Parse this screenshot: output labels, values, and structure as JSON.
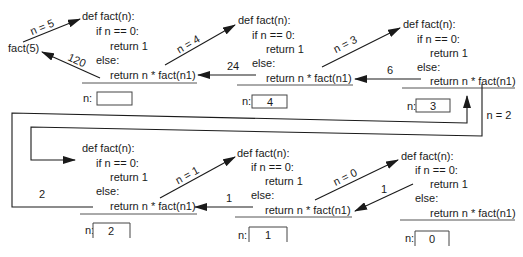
{
  "diagram": {
    "initial_call": "fact(5)",
    "frames": [
      {
        "code": [
          "def fact(n):",
          "if n == 0:",
          "return 1",
          "else:",
          "return n * fact(n1)"
        ],
        "n_label": "n:",
        "n_value": ""
      },
      {
        "code": [
          "def fact(n):",
          "if n == 0:",
          "return 1",
          "else:",
          "return n * fact(n1)"
        ],
        "n_label": "n:",
        "n_value": "4"
      },
      {
        "code": [
          "def fact(n):",
          "if n == 0:",
          "return 1",
          "else:",
          "return n * fact(n1)"
        ],
        "n_label": "n:",
        "n_value": "3"
      },
      {
        "code": [
          "def fact(n):",
          "if n == 0:",
          "return 1",
          "else:",
          "return n * fact(n1)"
        ],
        "n_label": "n:",
        "n_value": "2"
      },
      {
        "code": [
          "def fact(n):",
          "if n == 0:",
          "return 1",
          "else:",
          "return n * fact(n1)"
        ],
        "n_label": "n:",
        "n_value": "1"
      },
      {
        "code": [
          "def fact(n):",
          "if n == 0:",
          "return 1",
          "else:",
          "return n * fact(n1)"
        ],
        "n_label": "n:",
        "n_value": "0"
      }
    ],
    "call_labels": [
      "n = 5",
      "n = 4",
      "n = 3",
      "n = 2",
      "n = 1",
      "n = 0"
    ],
    "return_labels": [
      "120",
      "24",
      "6",
      "2",
      "1",
      "1"
    ],
    "colors": {
      "line": "#1a1a1a",
      "text": "#1a1a1a",
      "background": "#ffffff"
    }
  }
}
